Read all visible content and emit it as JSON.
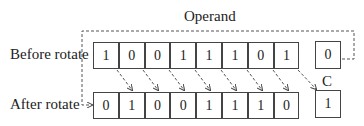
{
  "title": "Operand",
  "rows": {
    "before": {
      "label": "Before rotate",
      "bits": [
        "1",
        "0",
        "0",
        "1",
        "1",
        "1",
        "0",
        "1"
      ],
      "carry": "0"
    },
    "after": {
      "label": "After rotate",
      "bits": [
        "0",
        "1",
        "0",
        "0",
        "1",
        "1",
        "1",
        "0"
      ],
      "carry": "1"
    }
  },
  "carry_label": "C"
}
